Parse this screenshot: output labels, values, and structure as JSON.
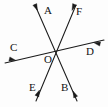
{
  "figure": {
    "kind": "geometry-diagram",
    "width": 108,
    "height": 107,
    "background_color": "#fdfdfd",
    "stroke_color": "#1a1a1a",
    "label_color": "#121212",
    "points": [
      {
        "id": "A",
        "label": "A",
        "x": 44,
        "y": 5,
        "role": "ray-endpoint-label"
      },
      {
        "id": "F",
        "label": "F",
        "x": 76,
        "y": 6,
        "role": "ray-endpoint-label"
      },
      {
        "id": "C",
        "label": "C",
        "x": 10,
        "y": 42,
        "role": "ray-endpoint-label"
      },
      {
        "id": "D",
        "label": "D",
        "x": 86,
        "y": 46,
        "role": "ray-endpoint-label"
      },
      {
        "id": "O",
        "label": "O",
        "x": 44,
        "y": 54,
        "role": "intersection-label"
      },
      {
        "id": "E",
        "label": "E",
        "x": 29,
        "y": 82,
        "role": "ray-endpoint-label"
      },
      {
        "id": "B",
        "label": "B",
        "x": 61,
        "y": 82,
        "role": "ray-endpoint-label"
      }
    ],
    "intersection": {
      "id": "O",
      "x": 56,
      "y": 51
    },
    "lines": [
      {
        "id": "line-AB",
        "name": "line-a-b",
        "from": "A",
        "to": "B",
        "x1": 35,
        "y1": 5,
        "x2": 77,
        "y2": 101,
        "arrow_at_from": true,
        "arrow_at_to": true
      },
      {
        "id": "line-EF",
        "name": "line-e-f",
        "from": "E",
        "to": "F",
        "x1": 36,
        "y1": 101,
        "x2": 76,
        "y2": 5,
        "arrow_at_from": true,
        "arrow_at_to": true
      },
      {
        "id": "line-CD",
        "name": "line-c-d",
        "from": "C",
        "to": "D",
        "x1": 5,
        "y1": 63,
        "x2": 104,
        "y2": 40,
        "arrow_at_from": true,
        "arrow_at_to": true
      }
    ],
    "arrowheads": [
      {
        "id": "arrow-A",
        "on": "line-AB",
        "tip_x": 37.5,
        "tip_y": 10.5,
        "angle_deg": 246
      },
      {
        "id": "arrow-B",
        "on": "line-AB",
        "tip_x": 73.0,
        "tip_y": 91.0,
        "angle_deg": 66
      },
      {
        "id": "arrow-E",
        "on": "line-EF",
        "tip_x": 39.5,
        "tip_y": 90.0,
        "angle_deg": 113
      },
      {
        "id": "arrow-F",
        "on": "line-EF",
        "tip_x": 72.0,
        "tip_y": 10.5,
        "angle_deg": 293
      },
      {
        "id": "arrow-C",
        "on": "line-CD",
        "tip_x": 16.0,
        "tip_y": 60.5,
        "angle_deg": 193
      },
      {
        "id": "arrow-D",
        "on": "line-CD",
        "tip_x": 93.5,
        "tip_y": 42.5,
        "angle_deg": 13
      }
    ]
  }
}
